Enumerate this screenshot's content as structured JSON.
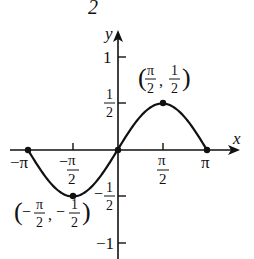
{
  "header_fragment": "2",
  "chart_data": {
    "type": "line",
    "function": "y = (1/2) sin x",
    "title": "",
    "xlabel": "x",
    "ylabel": "y",
    "xlim": [
      -3.14159,
      3.14159
    ],
    "ylim": [
      -1,
      1
    ],
    "grid": false,
    "x_ticks": [
      {
        "value": -3.14159,
        "label": "−π"
      },
      {
        "value": -1.5708,
        "label_num": "π",
        "label_den": "2",
        "sign": "−"
      },
      {
        "value": 1.5708,
        "label_num": "π",
        "label_den": "2",
        "sign": ""
      },
      {
        "value": 3.14159,
        "label": "π"
      }
    ],
    "y_ticks": [
      {
        "value": 1,
        "label": "1"
      },
      {
        "value": 0.5,
        "label_num": "1",
        "label_den": "2",
        "sign": ""
      },
      {
        "value": -0.5,
        "label_num": "1",
        "label_den": "2",
        "sign": "−"
      },
      {
        "value": -1,
        "label": "−1"
      }
    ],
    "series": [
      {
        "name": "y = ½ sin x",
        "x": [
          -3.14159,
          -1.5708,
          0,
          1.5708,
          3.14159
        ],
        "y": [
          0,
          -0.5,
          0,
          0.5,
          0
        ]
      }
    ],
    "marked_points": [
      {
        "x": -3.14159,
        "y": 0
      },
      {
        "x": -1.5708,
        "y": -0.5,
        "annotation": "(−π/2, −1/2)"
      },
      {
        "x": 0,
        "y": 0
      },
      {
        "x": 1.5708,
        "y": 0.5,
        "annotation": "(π/2, 1/2)"
      },
      {
        "x": 3.14159,
        "y": 0
      }
    ]
  },
  "labels": {
    "x_axis": "x",
    "y_axis": "y",
    "neg_pi": "−π",
    "pi": "π",
    "pi_sym": "π",
    "two": "2",
    "one": "1",
    "neg_one": "−1",
    "minus": "−",
    "ann_max_open": "(",
    "ann_max_close": ")",
    "ann_min_open": "(",
    "ann_min_close": ")",
    "comma": ","
  }
}
